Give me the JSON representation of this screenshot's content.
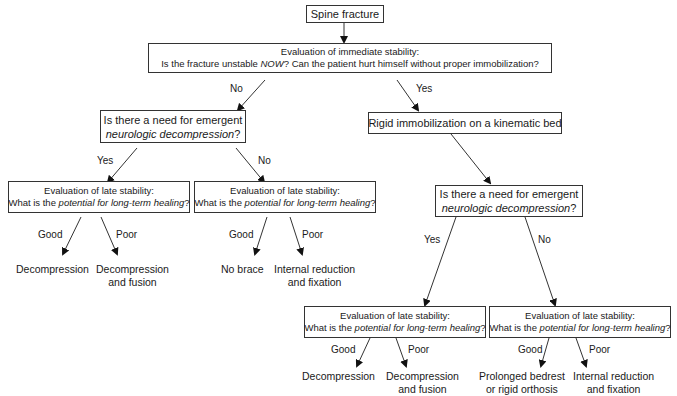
{
  "root": {
    "label": "Spine fracture"
  },
  "immediate": {
    "line1": "Evaluation of immediate stability:",
    "line2_pre": "Is the fracture unstable ",
    "line2_em": "NOW",
    "line2_post": "? Can the patient hurt himself without proper immobilization?"
  },
  "edges": {
    "no": "No",
    "yes": "Yes",
    "good": "Good",
    "poor": "Poor"
  },
  "left_question": {
    "line1": "Is there a need for emergent",
    "line2_em": "neurologic decompression",
    "line2_post": "?"
  },
  "right_immob": {
    "label": "Rigid immobilization on a kinematic bed"
  },
  "right_question": {
    "line1": "Is there a need for emergent",
    "line2_em": "neurologic decompression",
    "line2_post": "?"
  },
  "late": {
    "line1": "Evaluation of late stability:",
    "line2_pre": "What is the ",
    "line2_em": "potential for long-term healing",
    "line2_post": "?"
  },
  "outcomes": {
    "ll_good": "Decompression",
    "ll_poor_1": "Decompression",
    "ll_poor_2": "and fusion",
    "lr_good": "No brace",
    "lr_poor_1": "Internal reduction",
    "lr_poor_2": "and fixation",
    "rl_good": "Decompression",
    "rl_poor_1": "Decompression",
    "rl_poor_2": "and fusion",
    "rr_good_1": "Prolonged bedrest",
    "rr_good_2": "or rigid orthosis",
    "rr_poor_1": "Internal reduction",
    "rr_poor_2": "and fixation"
  }
}
